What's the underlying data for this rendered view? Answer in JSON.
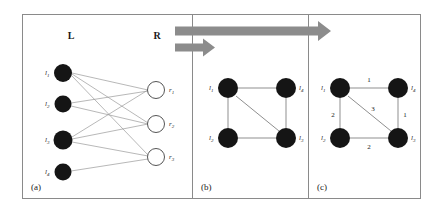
{
  "figure": {
    "title": "",
    "background_color": "#ffffff",
    "frame_color": "#8a8a8a",
    "panels": [
      {
        "id": "a",
        "label": "(a)"
      },
      {
        "id": "b",
        "label": "(b)"
      },
      {
        "id": "c",
        "label": "(c)"
      }
    ]
  },
  "panel_a": {
    "label": "(a)",
    "set_left_label": "L",
    "set_right_label": "R",
    "left_nodes": [
      {
        "id": "l1",
        "label": "l",
        "sub": "1",
        "cx": 63,
        "cy": 73,
        "r": 9,
        "fill": "#151515"
      },
      {
        "id": "l2",
        "label": "l",
        "sub": "2",
        "cx": 63,
        "cy": 104,
        "r": 8.5,
        "fill": "#151515"
      },
      {
        "id": "l3",
        "label": "l",
        "sub": "3",
        "cx": 63,
        "cy": 140,
        "r": 9.5,
        "fill": "#151515"
      },
      {
        "id": "l4",
        "label": "l",
        "sub": "4",
        "cx": 63,
        "cy": 172,
        "r": 8.5,
        "fill": "#151515"
      }
    ],
    "right_nodes": [
      {
        "id": "r1",
        "label": "r",
        "sub": "1",
        "cx": 156,
        "cy": 90,
        "r": 8.5,
        "fill": "#ffffff",
        "stroke": "#555555"
      },
      {
        "id": "r2",
        "label": "r",
        "sub": "2",
        "cx": 156,
        "cy": 124,
        "r": 8.5,
        "fill": "#ffffff",
        "stroke": "#555555"
      },
      {
        "id": "r3",
        "label": "r",
        "sub": "3",
        "cx": 156,
        "cy": 157,
        "r": 8.5,
        "fill": "#ffffff",
        "stroke": "#555555"
      }
    ],
    "edges": [
      {
        "from": "l1",
        "to": "r1"
      },
      {
        "from": "l1",
        "to": "r2"
      },
      {
        "from": "l1",
        "to": "r3"
      },
      {
        "from": "l2",
        "to": "r1"
      },
      {
        "from": "l2",
        "to": "r2"
      },
      {
        "from": "l3",
        "to": "r1"
      },
      {
        "from": "l3",
        "to": "r2"
      },
      {
        "from": "l3",
        "to": "r3"
      },
      {
        "from": "l4",
        "to": "r3"
      }
    ],
    "edge_color": "#9a9a9a"
  },
  "panel_b": {
    "label": "(b)",
    "nodes": [
      {
        "id": "l1",
        "label": "l",
        "sub": "1",
        "cx": 228,
        "cy": 88,
        "r": 10,
        "label_side": "left"
      },
      {
        "id": "l4",
        "label": "l",
        "sub": "4",
        "cx": 286,
        "cy": 88,
        "r": 10,
        "label_side": "right"
      },
      {
        "id": "l2",
        "label": "l",
        "sub": "2",
        "cx": 228,
        "cy": 138,
        "r": 10,
        "label_side": "left"
      },
      {
        "id": "l3",
        "label": "l",
        "sub": "3",
        "cx": 286,
        "cy": 138,
        "r": 10,
        "label_side": "right"
      }
    ],
    "edges": [
      {
        "from": "l1",
        "to": "l4"
      },
      {
        "from": "l1",
        "to": "l2"
      },
      {
        "from": "l1",
        "to": "l3"
      },
      {
        "from": "l2",
        "to": "l3"
      },
      {
        "from": "l4",
        "to": "l3"
      }
    ],
    "node_fill": "#151515",
    "edge_color": "#8f8f8f"
  },
  "panel_c": {
    "label": "(c)",
    "nodes": [
      {
        "id": "l1",
        "label": "l",
        "sub": "1",
        "cx": 340,
        "cy": 88,
        "r": 10,
        "label_side": "left"
      },
      {
        "id": "l4",
        "label": "l",
        "sub": "4",
        "cx": 398,
        "cy": 88,
        "r": 10,
        "label_side": "right"
      },
      {
        "id": "l2",
        "label": "l",
        "sub": "2",
        "cx": 340,
        "cy": 138,
        "r": 10,
        "label_side": "left"
      },
      {
        "id": "l3",
        "label": "l",
        "sub": "3",
        "cx": 398,
        "cy": 138,
        "r": 10,
        "label_side": "right"
      }
    ],
    "edges": [
      {
        "from": "l1",
        "to": "l4",
        "weight": "1",
        "wx": 369,
        "wy": 81
      },
      {
        "from": "l1",
        "to": "l2",
        "weight": "2",
        "wx": 333,
        "wy": 115
      },
      {
        "from": "l1",
        "to": "l3",
        "weight": "3",
        "wx": 372,
        "wy": 112
      },
      {
        "from": "l2",
        "to": "l3",
        "weight": "2",
        "wx": 369,
        "wy": 148
      },
      {
        "from": "l4",
        "to": "l3",
        "weight": "1",
        "wx": 404,
        "wy": 115
      }
    ],
    "node_fill": "#151515",
    "edge_color": "#8f8f8f"
  },
  "arrows": {
    "color": "#8c8c8c",
    "long_arrow": {
      "x1": 175,
      "x2": 330,
      "y": 31,
      "thickness": 9
    },
    "short_arrow": {
      "x1": 175,
      "x2": 216,
      "y": 48,
      "thickness": 8
    }
  }
}
